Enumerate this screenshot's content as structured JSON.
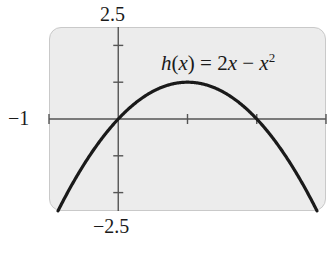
{
  "chart_data": {
    "type": "line",
    "title": "",
    "function": "h(x) = 2x - x^2",
    "annotation": {
      "text_parts": {
        "fname": "h",
        "var": "x",
        "lhs_open": "(",
        "lhs_close": ")",
        "eq": " = 2",
        "minus": " − ",
        "exp": "2"
      },
      "display": "h(x) = 2x − x²"
    },
    "window": {
      "xmin": -1,
      "xmax": 3,
      "ymin": -2.5,
      "ymax": 2.5,
      "xscl": 1,
      "yscl": 1
    },
    "tick_labels": {
      "ymax": "2.5",
      "ymin": "−2.5",
      "xmin": "−1"
    },
    "xlabel": "",
    "ylabel": "",
    "xlim": [
      -1,
      3
    ],
    "ylim": [
      -2.5,
      2.5
    ],
    "grid": false,
    "legend": null,
    "series": [
      {
        "name": "h(x) = 2x − x²",
        "x": [
          -0.85,
          -0.5,
          0,
          0.5,
          1,
          1.5,
          2,
          2.5,
          2.85
        ],
        "y": [
          -2.42,
          -1.25,
          0,
          0.75,
          1,
          0.75,
          0,
          -1.25,
          -2.42
        ]
      }
    ],
    "key_points": {
      "vertex": [
        1,
        1
      ],
      "x_intercepts": [
        [
          0,
          0
        ],
        [
          2,
          0
        ]
      ]
    }
  },
  "colors": {
    "curve": "#1a1a1a",
    "axis": "#555555",
    "screen_fill": "#ececec",
    "screen_border": "#c9c9c9"
  }
}
